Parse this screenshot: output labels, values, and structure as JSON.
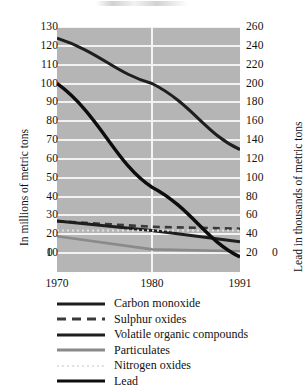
{
  "chart_data": {
    "type": "line",
    "title": "",
    "xlabel": "",
    "ylabel": "In millions of metric tons",
    "y2label": "Lead in thousands of metric tons",
    "x": [
      1970,
      1980,
      1991
    ],
    "xticklabels": [
      "1970",
      "1980",
      "1991"
    ],
    "ylim": [
      0,
      130
    ],
    "yticks": [
      130,
      120,
      110,
      100,
      90,
      80,
      70,
      60,
      50,
      40,
      30,
      20,
      10
    ],
    "yticklabels": [
      "130",
      "120",
      "110",
      "100",
      "90",
      "80",
      "70",
      "60",
      "50",
      "40",
      "30",
      "20",
      "10"
    ],
    "y_zero_label": "0",
    "y2lim": [
      0,
      260
    ],
    "y2ticks": [
      260,
      240,
      220,
      200,
      180,
      160,
      140,
      120,
      100,
      80,
      60,
      40,
      20
    ],
    "y2ticklabels": [
      "260",
      "240",
      "220",
      "200",
      "180",
      "160",
      "140",
      "120",
      "100",
      "80",
      "60",
      "40",
      "20"
    ],
    "y2_zero_label": "0",
    "grid": true,
    "grid_color": "#f2f2f2",
    "plot_background": "#b5b5b5",
    "legend_position": "below",
    "series": [
      {
        "name": "Carbon monoxide",
        "axis": "left",
        "style": "solid",
        "color": "#1e1e1e",
        "width": 3.0,
        "values": [
          124,
          100,
          65
        ]
      },
      {
        "name": "Sulphur oxides",
        "axis": "left",
        "style": "dashed",
        "color": "#3a3a3a",
        "width": 2.6,
        "values": [
          27,
          24,
          23
        ]
      },
      {
        "name": "Volatile organic compounds",
        "axis": "left",
        "style": "solid",
        "color": "#1e1e1e",
        "width": 3.0,
        "values": [
          27,
          22,
          16
        ]
      },
      {
        "name": "Particulates",
        "axis": "left",
        "style": "solid",
        "color": "#8a8a8a",
        "width": 2.6,
        "values": [
          19,
          12,
          11
        ]
      },
      {
        "name": "Nitrogen oxides",
        "axis": "left",
        "style": "dotted",
        "color": "#e0e0e0",
        "width": 2.0,
        "values": [
          22,
          22,
          22
        ]
      },
      {
        "name": "Lead",
        "axis": "right",
        "style": "solid",
        "color": "#0d0d0d",
        "width": 3.4,
        "values": [
          200,
          90,
          16
        ]
      }
    ]
  },
  "legend": {
    "items": [
      {
        "label": "Carbon monoxide"
      },
      {
        "label": "Sulphur oxides"
      },
      {
        "label": "Volatile organic compounds"
      },
      {
        "label": "Particulates"
      },
      {
        "label": "Nitrogen oxides"
      },
      {
        "label": "Lead"
      }
    ]
  }
}
